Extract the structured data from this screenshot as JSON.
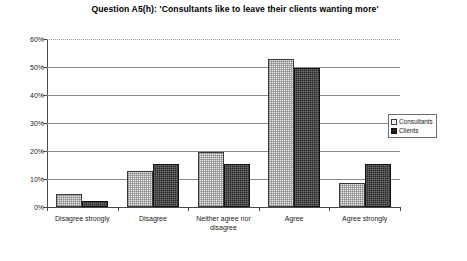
{
  "chart_data": {
    "type": "bar",
    "title": "Question A5(h): 'Consultants like to leave their clients wanting more'",
    "xlabel": "",
    "ylabel": "",
    "ylim": [
      0,
      60
    ],
    "yticks": [
      "0%",
      "10%",
      "20%",
      "30%",
      "40%",
      "50%",
      "60%"
    ],
    "ytick_values": [
      0,
      10,
      20,
      30,
      40,
      50,
      60
    ],
    "grid": true,
    "legend_position": "right",
    "categories": [
      "Disagree strongly",
      "Disagree",
      "Neither agree nor disagree",
      "Agree",
      "Agree strongly"
    ],
    "series": [
      {
        "name": "Consultants",
        "color": "#e9e9e9",
        "values": [
          4.5,
          13.0,
          19.5,
          53.0,
          8.5
        ]
      },
      {
        "name": "Clients",
        "color": "#2b2b2b",
        "values": [
          2.0,
          15.5,
          15.5,
          49.5,
          15.5
        ]
      }
    ]
  },
  "legend": {
    "items": [
      {
        "label": "Consultants"
      },
      {
        "label": "Clients"
      }
    ]
  }
}
